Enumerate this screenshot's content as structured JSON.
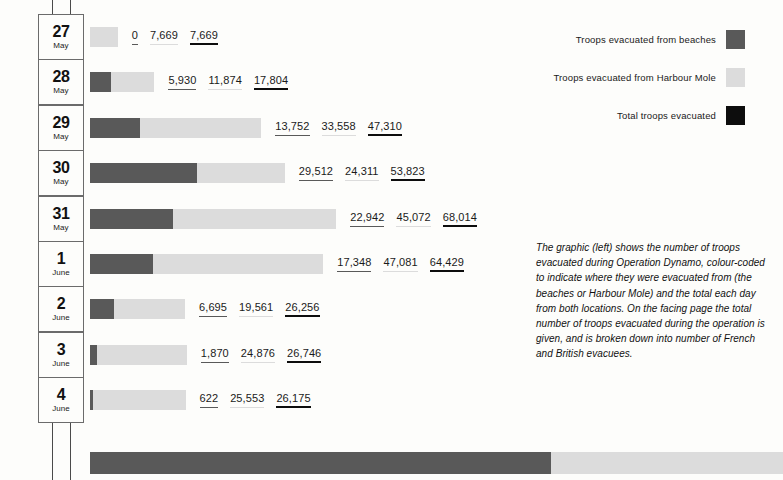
{
  "colors": {
    "beaches": "#595959",
    "harbour_mole": "#dcdcdc",
    "total": "#0d0d0d",
    "background": "#fdfdfb",
    "rule": "#6b6b6b"
  },
  "legend": {
    "items": [
      {
        "label": "Troops evacuated from beaches",
        "swatch": "#595959",
        "icon": "dark-gray-square-swatch"
      },
      {
        "label": "Troops evacuated from Harbour Mole",
        "swatch": "#dcdcdc",
        "icon": "light-gray-square-swatch"
      },
      {
        "label": "Total troops evacuated",
        "swatch": "#0d0d0d",
        "icon": "black-square-swatch"
      }
    ]
  },
  "caption": {
    "text": "The graphic (left) shows the number of troops evacuated during Operation Dynamo, colour-coded to indicate where they were evacuated from (the beaches or Harbour Mole) and the total each day from both locations. On the facing page the total number of troops evacuated during the operation is given, and is broken down into number of French and British evacuees."
  },
  "chart_data": {
    "type": "bar",
    "orientation": "horizontal",
    "stacked": true,
    "title": "",
    "xlabel": "",
    "ylabel": "",
    "grid": false,
    "legend_position": "top-right",
    "categories": [
      "27 May",
      "28 May",
      "29 May",
      "30 May",
      "31 May",
      "1 June",
      "2 June",
      "3 June",
      "4 June"
    ],
    "series": [
      {
        "name": "Troops evacuated from beaches",
        "color": "#595959",
        "values": [
          0,
          5930,
          13752,
          29512,
          22942,
          17348,
          6695,
          1870,
          622
        ]
      },
      {
        "name": "Troops evacuated from Harbour Mole",
        "color": "#dcdcdc",
        "values": [
          7669,
          11874,
          33558,
          24311,
          45072,
          47081,
          19561,
          24876,
          25553
        ]
      },
      {
        "name": "Total troops evacuated",
        "color": "#0d0d0d",
        "values": [
          7669,
          17804,
          47310,
          53823,
          68014,
          64429,
          26256,
          26746,
          26175
        ]
      }
    ]
  },
  "rows": [
    {
      "day": "27",
      "month": "May",
      "beaches": 0,
      "harbour_mole": 7669,
      "total": 7669,
      "beaches_label": "0",
      "harbour_mole_label": "7,669",
      "total_label": "7,669"
    },
    {
      "day": "28",
      "month": "May",
      "beaches": 5930,
      "harbour_mole": 11874,
      "total": 17804,
      "beaches_label": "5,930",
      "harbour_mole_label": "11,874",
      "total_label": "17,804"
    },
    {
      "day": "29",
      "month": "May",
      "beaches": 13752,
      "harbour_mole": 33558,
      "total": 47310,
      "beaches_label": "13,752",
      "harbour_mole_label": "33,558",
      "total_label": "47,310"
    },
    {
      "day": "30",
      "month": "May",
      "beaches": 29512,
      "harbour_mole": 24311,
      "total": 53823,
      "beaches_label": "29,512",
      "harbour_mole_label": "24,311",
      "total_label": "53,823"
    },
    {
      "day": "31",
      "month": "May",
      "beaches": 22942,
      "harbour_mole": 45072,
      "total": 68014,
      "beaches_label": "22,942",
      "harbour_mole_label": "45,072",
      "total_label": "68,014"
    },
    {
      "day": "1",
      "month": "June",
      "beaches": 17348,
      "harbour_mole": 47081,
      "total": 64429,
      "beaches_label": "17,348",
      "harbour_mole_label": "47,081",
      "total_label": "64,429"
    },
    {
      "day": "2",
      "month": "June",
      "beaches": 6695,
      "harbour_mole": 19561,
      "total": 26256,
      "beaches_label": "6,695",
      "harbour_mole_label": "19,561",
      "total_label": "26,256"
    },
    {
      "day": "3",
      "month": "June",
      "beaches": 1870,
      "harbour_mole": 24876,
      "total": 26746,
      "beaches_label": "1,870",
      "harbour_mole_label": "24,876",
      "total_label": "26,746"
    },
    {
      "day": "4",
      "month": "June",
      "beaches": 622,
      "harbour_mole": 25553,
      "total": 26175,
      "beaches_label": "622",
      "harbour_mole_label": "25,553",
      "total_label": "26,175"
    }
  ],
  "summary_bar": {
    "beaches": 98671,
    "harbour_mole": 239555,
    "beaches_px": 461,
    "harbour_mole_px": 232
  },
  "geometry": {
    "bar_origin_x": 90,
    "px_per_1000": 3.62,
    "row_pitch": 45.4,
    "first_row_top": 14
  }
}
